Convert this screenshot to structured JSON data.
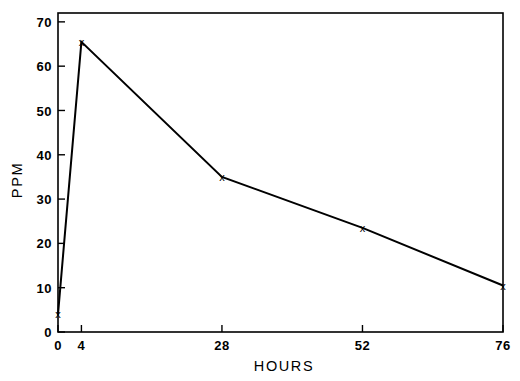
{
  "chart_data": {
    "type": "line",
    "title": "",
    "xlabel": "HOURS",
    "ylabel": "PPM",
    "x": [
      0,
      4,
      28,
      52,
      76
    ],
    "values": [
      4,
      65.5,
      35,
      23.5,
      10.5
    ],
    "series": [
      {
        "name": "PPM",
        "x": [
          0,
          4,
          28,
          52,
          76
        ],
        "values": [
          4,
          65.5,
          35,
          23.5,
          10.5
        ]
      }
    ],
    "xticks": [
      0,
      4,
      28,
      52,
      76
    ],
    "xtick_labels": [
      "0",
      "4",
      "28",
      "52",
      "76"
    ],
    "yticks": [
      0,
      10,
      20,
      30,
      40,
      50,
      60,
      70
    ],
    "ytick_labels": [
      "0",
      "10",
      "20",
      "30",
      "40",
      "50",
      "60",
      "70"
    ],
    "xlim": [
      0,
      76
    ],
    "ylim": [
      0,
      72
    ],
    "grid": false,
    "legend": false,
    "marker": "x",
    "marker_glyph": "x",
    "line_color": "#000000",
    "background_color": "#ffffff",
    "frame": "box"
  },
  "axes": {
    "y_axis_title": "PPM",
    "x_axis_title": "HOURS"
  }
}
